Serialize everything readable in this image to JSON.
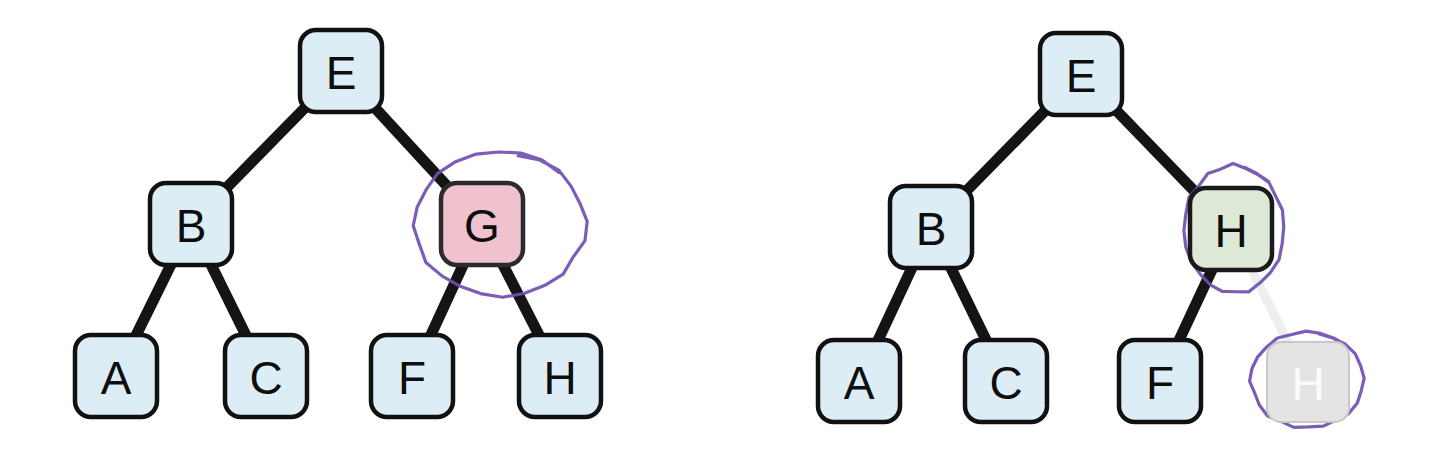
{
  "figure": {
    "background": "#ffffff",
    "width": 1452,
    "height": 455
  },
  "palette": {
    "node_blue_fill": "#dcedf5",
    "node_blue_stroke": "#111111",
    "node_pink_fill": "#f0c2ce",
    "node_pink_stroke": "#2b2b2b",
    "node_green_fill": "#dde9d6",
    "node_green_stroke": "#1a1a1a",
    "node_ghost_fill": "#e4e4e4",
    "node_ghost_stroke": "#c8c8c8",
    "node_ghost_text": "#fbfbfb",
    "edge_black": "#141414",
    "edge_ghost": "#eeeeee",
    "annotation_purple": "#6f4fb0",
    "label_text": "#0d0d0d"
  },
  "trees": [
    {
      "id": "before-tree",
      "name": "left-tree",
      "nodes": [
        {
          "id": "L-E",
          "label": "E",
          "style": "blue",
          "x": 300,
          "y": 30,
          "w": 82,
          "h": 82,
          "r": 16
        },
        {
          "id": "L-B",
          "label": "B",
          "style": "blue",
          "x": 150,
          "y": 183,
          "w": 82,
          "h": 82,
          "r": 16
        },
        {
          "id": "L-G",
          "label": "G",
          "style": "pink",
          "x": 441,
          "y": 183,
          "w": 82,
          "h": 82,
          "r": 16
        },
        {
          "id": "L-A",
          "label": "A",
          "style": "blue",
          "x": 75,
          "y": 335,
          "w": 82,
          "h": 82,
          "r": 16
        },
        {
          "id": "L-C",
          "label": "C",
          "style": "blue",
          "x": 225,
          "y": 335,
          "w": 82,
          "h": 82,
          "r": 16
        },
        {
          "id": "L-F",
          "label": "F",
          "style": "blue",
          "x": 371,
          "y": 335,
          "w": 82,
          "h": 82,
          "r": 16
        },
        {
          "id": "L-H",
          "label": "H",
          "style": "blue",
          "x": 519,
          "y": 335,
          "w": 82,
          "h": 82,
          "r": 16
        }
      ],
      "edges": [
        {
          "id": "L-E-B",
          "from": "L-E",
          "to": "L-B",
          "style": "solid"
        },
        {
          "id": "L-E-G",
          "from": "L-E",
          "to": "L-G",
          "style": "solid"
        },
        {
          "id": "L-B-A",
          "from": "L-B",
          "to": "L-A",
          "style": "solid"
        },
        {
          "id": "L-B-C",
          "from": "L-B",
          "to": "L-C",
          "style": "solid"
        },
        {
          "id": "L-G-F",
          "from": "L-G",
          "to": "L-F",
          "style": "solid"
        },
        {
          "id": "L-G-H",
          "from": "L-G",
          "to": "L-H",
          "style": "solid"
        }
      ],
      "annotations": [
        {
          "id": "L-circle-G",
          "kind": "hand-drawn-ellipse",
          "targets": [
            "L-G"
          ],
          "cx": 500,
          "cy": 224,
          "rx": 85,
          "ry": 72
        }
      ]
    },
    {
      "id": "after-tree",
      "name": "right-tree",
      "nodes": [
        {
          "id": "R-E",
          "label": "E",
          "style": "blue",
          "x": 1040,
          "y": 33,
          "w": 82,
          "h": 82,
          "r": 16
        },
        {
          "id": "R-B",
          "label": "B",
          "style": "blue",
          "x": 890,
          "y": 186,
          "w": 82,
          "h": 82,
          "r": 16
        },
        {
          "id": "R-H",
          "label": "H",
          "style": "green",
          "x": 1190,
          "y": 188,
          "w": 82,
          "h": 82,
          "r": 16
        },
        {
          "id": "R-A",
          "label": "A",
          "style": "blue",
          "x": 818,
          "y": 340,
          "w": 82,
          "h": 82,
          "r": 16
        },
        {
          "id": "R-C",
          "label": "C",
          "style": "blue",
          "x": 965,
          "y": 340,
          "w": 82,
          "h": 82,
          "r": 16
        },
        {
          "id": "R-F",
          "label": "F",
          "style": "blue",
          "x": 1119,
          "y": 340,
          "w": 82,
          "h": 82,
          "r": 16
        },
        {
          "id": "R-H-ghost",
          "label": "H",
          "style": "ghost",
          "x": 1267,
          "y": 342,
          "w": 82,
          "h": 80,
          "r": 14
        }
      ],
      "edges": [
        {
          "id": "R-E-B",
          "from": "R-E",
          "to": "R-B",
          "style": "solid"
        },
        {
          "id": "R-E-H",
          "from": "R-E",
          "to": "R-H",
          "style": "solid"
        },
        {
          "id": "R-B-A",
          "from": "R-B",
          "to": "R-A",
          "style": "solid"
        },
        {
          "id": "R-B-C",
          "from": "R-B",
          "to": "R-C",
          "style": "solid"
        },
        {
          "id": "R-H-F",
          "from": "R-H",
          "to": "R-F",
          "style": "solid"
        },
        {
          "id": "R-H-ghost-edge",
          "from": "R-H",
          "to": "R-H-ghost",
          "style": "ghost"
        }
      ],
      "annotations": [
        {
          "id": "R-circle-H",
          "kind": "hand-drawn-ellipse",
          "targets": [
            "R-H"
          ],
          "cx": 1234,
          "cy": 229,
          "rx": 50,
          "ry": 64
        },
        {
          "id": "R-circle-H-ghost",
          "kind": "hand-drawn-ellipse",
          "targets": [
            "R-H-ghost"
          ],
          "cx": 1307,
          "cy": 380,
          "rx": 56,
          "ry": 48
        }
      ]
    }
  ],
  "chart_data": {
    "type": "diagram",
    "subtype": "binary-tree-pair",
    "panels": [
      {
        "name": "before",
        "root": "E",
        "structure": {
          "E": {
            "left": "B",
            "right": "G"
          },
          "B": {
            "left": "A",
            "right": "C"
          },
          "G": {
            "left": "F",
            "right": "H"
          },
          "A": {
            "left": null,
            "right": null
          },
          "C": {
            "left": null,
            "right": null
          },
          "F": {
            "left": null,
            "right": null
          },
          "H": {
            "left": null,
            "right": null
          }
        },
        "node_labels": [
          "E",
          "B",
          "G",
          "A",
          "C",
          "F",
          "H"
        ],
        "highlighted": [
          "G"
        ],
        "highlight_color": "#f0c2ce",
        "circled": [
          "G"
        ]
      },
      {
        "name": "after",
        "root": "E",
        "structure": {
          "E": {
            "left": "B",
            "right": "H"
          },
          "B": {
            "left": "A",
            "right": "C"
          },
          "H": {
            "left": "F",
            "right": "H(removed)"
          },
          "A": {
            "left": null,
            "right": null
          },
          "C": {
            "left": null,
            "right": null
          },
          "F": {
            "left": null,
            "right": null
          }
        },
        "node_labels": [
          "E",
          "B",
          "H",
          "A",
          "C",
          "F",
          "H"
        ],
        "highlighted": [
          "H"
        ],
        "highlight_color": "#dde9d6",
        "faded": [
          "H(removed)"
        ],
        "circled": [
          "H",
          "H(removed)"
        ]
      }
    ]
  }
}
